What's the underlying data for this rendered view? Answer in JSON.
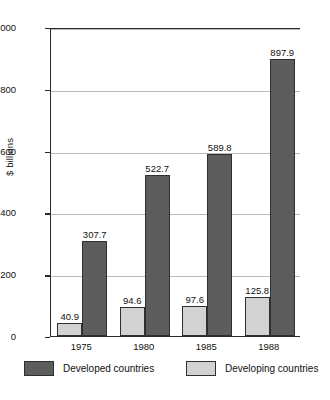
{
  "chart_data": {
    "type": "bar",
    "title": "",
    "xlabel": "",
    "ylabel": "$ billions",
    "categories": [
      "1975",
      "1980",
      "1985",
      "1988"
    ],
    "series": [
      {
        "name": "Developed countries",
        "color": "#5d5d5d",
        "values": [
          307.7,
          522.7,
          589.8,
          897.9
        ]
      },
      {
        "name": "Developing countries",
        "color": "#d2d2d2",
        "values": [
          40.9,
          94.6,
          97.6,
          125.8
        ]
      }
    ],
    "ylim": [
      0,
      1000
    ],
    "yticks": [
      0,
      200,
      400,
      600,
      800,
      1000
    ],
    "ytick_labels": [
      "0",
      "200",
      "400",
      "600",
      "800",
      "1,000"
    ],
    "grid": true,
    "legend_position": "bottom"
  },
  "legend": {
    "entries": [
      {
        "label": "Developed countries",
        "swatch": "developed"
      },
      {
        "label": "Developing countries",
        "swatch": "developing"
      }
    ]
  },
  "axis": {
    "y_title": "$ billions"
  },
  "bar_value_labels": {
    "developing": [
      "40.9",
      "94.6",
      "97.6",
      "125.8"
    ],
    "developed": [
      "307.7",
      "522.7",
      "589.8",
      "897.9"
    ]
  }
}
